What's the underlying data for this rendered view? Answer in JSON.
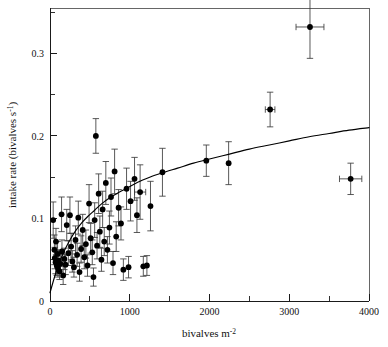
{
  "figure": {
    "caption_title": "",
    "background_color": "#ffffff",
    "point_color": "#000000",
    "errorbar_color": "#3b3b3b",
    "curve_color": "#000000"
  },
  "chart_data": {
    "type": "scatter",
    "title": "",
    "xlabel": "bivalves m",
    "xlabel_exponent": "-2",
    "ylabel": "intake rate (bivalves s",
    "ylabel_exponent": "-1",
    "ylabel_close": ")",
    "xlim": [
      0,
      4000
    ],
    "ylim": [
      0,
      0.355
    ],
    "grid": false,
    "legend": "none",
    "xticks": [
      0,
      1000,
      2000,
      3000,
      4000
    ],
    "xtick_labels": [
      "0",
      "1000",
      "2000",
      "3000",
      "4000"
    ],
    "xminor_ticks": [
      500,
      1500,
      2500,
      3500
    ],
    "yticks": [
      0,
      0.1,
      0.2,
      0.3
    ],
    "ytick_labels": [
      "0",
      "0.1",
      "0.2",
      "0.3"
    ],
    "yminor_ticks": [
      0.05,
      0.15,
      0.25,
      0.35
    ],
    "points": [
      {
        "x": 40,
        "y": 0.098,
        "yerr": 0.022,
        "xerr": 0
      },
      {
        "x": 55,
        "y": 0.062,
        "yerr": 0.018,
        "xerr": 0
      },
      {
        "x": 60,
        "y": 0.052,
        "yerr": 0.013,
        "xerr": 0
      },
      {
        "x": 70,
        "y": 0.047,
        "yerr": 0.014,
        "xerr": 0
      },
      {
        "x": 75,
        "y": 0.072,
        "yerr": 0.016,
        "xerr": 0
      },
      {
        "x": 85,
        "y": 0.043,
        "yerr": 0.012,
        "xerr": 0
      },
      {
        "x": 95,
        "y": 0.057,
        "yerr": 0.015,
        "xerr": 0
      },
      {
        "x": 100,
        "y": 0.04,
        "yerr": 0.011,
        "xerr": 0
      },
      {
        "x": 110,
        "y": 0.049,
        "yerr": 0.013,
        "xerr": 0
      },
      {
        "x": 120,
        "y": 0.036,
        "yerr": 0.01,
        "xerr": 0
      },
      {
        "x": 130,
        "y": 0.045,
        "yerr": 0.012,
        "xerr": 0
      },
      {
        "x": 145,
        "y": 0.105,
        "yerr": 0.021,
        "xerr": 0
      },
      {
        "x": 150,
        "y": 0.06,
        "yerr": 0.014,
        "xerr": 0
      },
      {
        "x": 165,
        "y": 0.031,
        "yerr": 0.011,
        "xerr": 0
      },
      {
        "x": 180,
        "y": 0.051,
        "yerr": 0.013,
        "xerr": 0
      },
      {
        "x": 195,
        "y": 0.044,
        "yerr": 0.012,
        "xerr": 0
      },
      {
        "x": 210,
        "y": 0.092,
        "yerr": 0.019,
        "xerr": 0
      },
      {
        "x": 230,
        "y": 0.058,
        "yerr": 0.015,
        "xerr": 0
      },
      {
        "x": 250,
        "y": 0.104,
        "yerr": 0.022,
        "xerr": 0
      },
      {
        "x": 265,
        "y": 0.066,
        "yerr": 0.016,
        "xerr": 0
      },
      {
        "x": 280,
        "y": 0.048,
        "yerr": 0.013,
        "xerr": 0
      },
      {
        "x": 300,
        "y": 0.041,
        "yerr": 0.012,
        "xerr": 0
      },
      {
        "x": 320,
        "y": 0.074,
        "yerr": 0.017,
        "xerr": 0
      },
      {
        "x": 340,
        "y": 0.056,
        "yerr": 0.014,
        "xerr": 0
      },
      {
        "x": 355,
        "y": 0.101,
        "yerr": 0.02,
        "xerr": 0
      },
      {
        "x": 370,
        "y": 0.035,
        "yerr": 0.011,
        "xerr": 0
      },
      {
        "x": 390,
        "y": 0.063,
        "yerr": 0.016,
        "xerr": 0
      },
      {
        "x": 410,
        "y": 0.086,
        "yerr": 0.019,
        "xerr": 0
      },
      {
        "x": 430,
        "y": 0.053,
        "yerr": 0.014,
        "xerr": 0
      },
      {
        "x": 450,
        "y": 0.069,
        "yerr": 0.017,
        "xerr": 0
      },
      {
        "x": 470,
        "y": 0.043,
        "yerr": 0.013,
        "xerr": 0
      },
      {
        "x": 490,
        "y": 0.118,
        "yerr": 0.023,
        "xerr": 0
      },
      {
        "x": 510,
        "y": 0.076,
        "yerr": 0.018,
        "xerr": 0
      },
      {
        "x": 530,
        "y": 0.059,
        "yerr": 0.015,
        "xerr": 0
      },
      {
        "x": 545,
        "y": 0.029,
        "yerr": 0.011,
        "xerr": 0
      },
      {
        "x": 560,
        "y": 0.098,
        "yerr": 0.021,
        "xerr": 0
      },
      {
        "x": 575,
        "y": 0.2,
        "yerr": 0.021,
        "xerr": 0
      },
      {
        "x": 590,
        "y": 0.067,
        "yerr": 0.016,
        "xerr": 0
      },
      {
        "x": 610,
        "y": 0.13,
        "yerr": 0.024,
        "xerr": 0
      },
      {
        "x": 625,
        "y": 0.084,
        "yerr": 0.019,
        "xerr": 0
      },
      {
        "x": 645,
        "y": 0.05,
        "yerr": 0.014,
        "xerr": 0
      },
      {
        "x": 660,
        "y": 0.111,
        "yerr": 0.022,
        "xerr": 0
      },
      {
        "x": 680,
        "y": 0.072,
        "yerr": 0.017,
        "xerr": 0
      },
      {
        "x": 700,
        "y": 0.143,
        "yerr": 0.026,
        "xerr": 0
      },
      {
        "x": 720,
        "y": 0.062,
        "yerr": 0.016,
        "xerr": 0
      },
      {
        "x": 745,
        "y": 0.089,
        "yerr": 0.02,
        "xerr": 0
      },
      {
        "x": 765,
        "y": 0.126,
        "yerr": 0.023,
        "xerr": 0
      },
      {
        "x": 790,
        "y": 0.046,
        "yerr": 0.014,
        "xerr": 0
      },
      {
        "x": 810,
        "y": 0.157,
        "yerr": 0.027,
        "xerr": 0
      },
      {
        "x": 830,
        "y": 0.078,
        "yerr": 0.018,
        "xerr": 0
      },
      {
        "x": 860,
        "y": 0.113,
        "yerr": 0.022,
        "xerr": 0
      },
      {
        "x": 890,
        "y": 0.094,
        "yerr": 0.02,
        "xerr": 0
      },
      {
        "x": 920,
        "y": 0.038,
        "yerr": 0.013,
        "xerr": 0
      },
      {
        "x": 960,
        "y": 0.136,
        "yerr": 0.025,
        "xerr": 0
      },
      {
        "x": 985,
        "y": 0.041,
        "yerr": 0.013,
        "xerr": 0
      },
      {
        "x": 1010,
        "y": 0.121,
        "yerr": 0.024,
        "xerr": 0
      },
      {
        "x": 1060,
        "y": 0.148,
        "yerr": 0.026,
        "xerr": 0
      },
      {
        "x": 1090,
        "y": 0.104,
        "yerr": 0.021,
        "xerr": 0
      },
      {
        "x": 1130,
        "y": 0.132,
        "yerr": 0.033,
        "xerr": 70
      },
      {
        "x": 1170,
        "y": 0.042,
        "yerr": 0.012,
        "xerr": 0
      },
      {
        "x": 1215,
        "y": 0.043,
        "yerr": 0.012,
        "xerr": 0
      },
      {
        "x": 1260,
        "y": 0.115,
        "yerr": 0.03,
        "xerr": 0
      },
      {
        "x": 1410,
        "y": 0.156,
        "yerr": 0.029,
        "xerr": 0
      },
      {
        "x": 1960,
        "y": 0.17,
        "yerr": 0.019,
        "xerr": 0
      },
      {
        "x": 2240,
        "y": 0.167,
        "yerr": 0.026,
        "xerr": 0
      },
      {
        "x": 2760,
        "y": 0.232,
        "yerr": 0.021,
        "xerr": 60
      },
      {
        "x": 3260,
        "y": 0.332,
        "yerr": 0.038,
        "xerr": 175
      },
      {
        "x": 3770,
        "y": 0.148,
        "yerr": 0.019,
        "xerr": 140
      }
    ],
    "fit_curve": {
      "model": "holling-type-II",
      "description": "fitted functional response curve",
      "x": [
        0,
        60,
        120,
        180,
        250,
        320,
        400,
        480,
        560,
        650,
        750,
        850,
        950,
        1100,
        1250,
        1400,
        1600,
        1800,
        2000,
        2250,
        2500,
        2750,
        3000,
        3250,
        3500,
        3750,
        4000
      ],
      "y": [
        0.01,
        0.03,
        0.047,
        0.061,
        0.074,
        0.085,
        0.095,
        0.103,
        0.11,
        0.118,
        0.125,
        0.131,
        0.136,
        0.144,
        0.15,
        0.155,
        0.161,
        0.167,
        0.172,
        0.178,
        0.184,
        0.189,
        0.194,
        0.199,
        0.203,
        0.207,
        0.21
      ]
    }
  }
}
